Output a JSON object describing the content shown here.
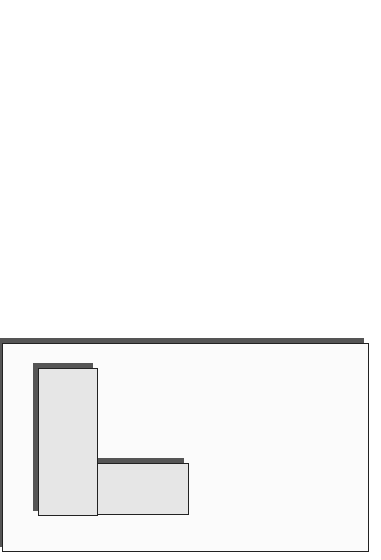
{
  "functions_panel": {
    "title": "Ecological System Functions",
    "developmental": {
      "title_line1": "Developmental",
      "title_line2": "Functions",
      "subtitle": "(Long-Term Dynamics)"
    },
    "core": {
      "title_line1": "Core",
      "title_line2": "Functions",
      "cycle_labels": {
        "self_organization_line1": "Self-",
        "self_organization_line2": "Organization",
        "regulation_line1": "Regulation/",
        "regulation_line2": "Adaptation",
        "propagation": "Propagation"
      }
    },
    "operational": {
      "title": "Operational Functions",
      "subtitle": "(Short-Term Dynamics)"
    },
    "caption": {
      "italic": "What",
      "line1_rest": " the",
      "line2": "System Does"
    }
  },
  "form_panel": {
    "title_line1": "Ecological System",
    "title_line2": "Form",
    "structure": {
      "title_line1": "System",
      "title_line2": "Structure",
      "subtitle": "(Networks)"
    },
    "processes": {
      "title_line1": "System",
      "title_line2": "Processes"
    },
    "caption": {
      "italic": "How",
      "line1_rest": " the",
      "line2": "System Does It"
    }
  },
  "note": {
    "line1": "System implementation consists of a derived",
    "line2": "STRUCTURE and a set of derived PROCESSES that",
    "line3": "deliver ecological system FUNCTIONALITY."
  },
  "colors": {
    "box_fill": "#e6e6e6",
    "shadow": "#555555",
    "arrow_dark": "#4a4a4a",
    "arrow_mid": "#8a8a8a",
    "arrow_light": "#cfcfcf"
  }
}
